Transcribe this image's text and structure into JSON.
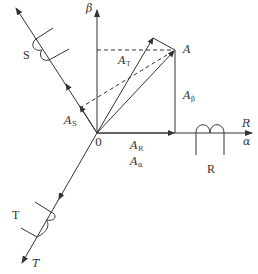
{
  "diagram": {
    "title": "",
    "origin_label": "0",
    "axes": {
      "beta": "β",
      "R_axis": "R",
      "alpha": "α",
      "T_axis": "T"
    },
    "windings": {
      "S": "S",
      "R": "R",
      "T": "T"
    },
    "vectors": {
      "A": "A",
      "A_T": {
        "base": "A",
        "sub": "T"
      },
      "A_S": {
        "base": "A",
        "sub": "S"
      },
      "A_R": {
        "base": "A",
        "sub": "R"
      },
      "A_alpha": {
        "base": "A",
        "sub": "α"
      },
      "A_beta": {
        "base": "A",
        "sub": "β"
      }
    },
    "colors": {
      "line": "#333333",
      "background": "#ffffff"
    }
  }
}
